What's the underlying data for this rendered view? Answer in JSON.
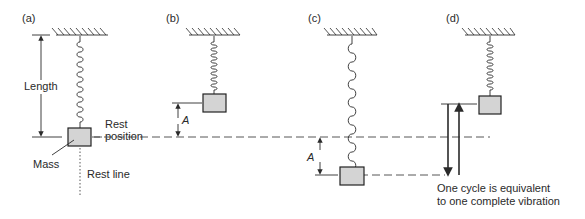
{
  "panels": {
    "a": {
      "label": "(a)",
      "length_label": "Length",
      "rest_position_label_1": "Rest",
      "rest_position_label_2": "position",
      "mass_label": "Mass",
      "rest_line_label": "Rest line"
    },
    "b": {
      "label": "(b)",
      "amplitude_label": "A"
    },
    "c": {
      "label": "(c)",
      "amplitude_label": "A"
    },
    "d": {
      "label": "(d)",
      "caption_line_1": "One cycle is equivalent",
      "caption_line_2": "to one complete vibration"
    }
  },
  "colors": {
    "mass_fill": "#d4d4d4",
    "stroke": "#2a2a2a"
  }
}
